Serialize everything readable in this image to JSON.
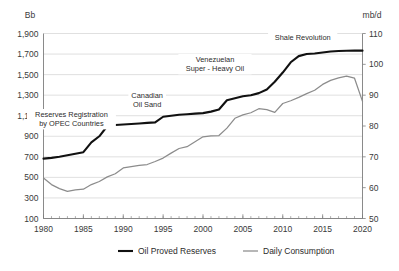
{
  "chart_data": {
    "type": "line",
    "title": "",
    "subtitle": "",
    "xlabel": "",
    "ylabel": "Bb",
    "y2label": "mb/d",
    "xlim": [
      1980,
      2020
    ],
    "ylim": [
      100,
      1900
    ],
    "y2lim": [
      50,
      110
    ],
    "grid": true,
    "legend_position": "bottom",
    "x_ticks": [
      "1980",
      "1985",
      "1990",
      "1995",
      "2000",
      "2005",
      "2010",
      "2015",
      "2020"
    ],
    "x_tick_values": [
      1980,
      1985,
      1990,
      1995,
      2000,
      2005,
      2010,
      2015,
      2020
    ],
    "y_ticks": [
      "100",
      "300",
      "500",
      "700",
      "900",
      "1,100",
      "1,300",
      "1,500",
      "1,700",
      "1,900"
    ],
    "y_tick_values": [
      100,
      300,
      500,
      700,
      900,
      1100,
      1300,
      1500,
      1700,
      1900
    ],
    "y2_ticks": [
      "50",
      "60",
      "70",
      "80",
      "90",
      "100",
      "110"
    ],
    "y2_tick_values": [
      50,
      60,
      70,
      80,
      90,
      100,
      110
    ],
    "x": [
      1980,
      1981,
      1982,
      1983,
      1984,
      1985,
      1986,
      1987,
      1988,
      1989,
      1990,
      1991,
      1992,
      1993,
      1994,
      1995,
      1996,
      1997,
      1998,
      1999,
      2000,
      2001,
      2002,
      2003,
      2004,
      2005,
      2006,
      2007,
      2008,
      2009,
      2010,
      2011,
      2012,
      2013,
      2014,
      2015,
      2016,
      2017,
      2018,
      2019,
      2020
    ],
    "series": [
      {
        "name": "Oil Proved Reserves",
        "axis": "left",
        "unit": "Bb",
        "color": "#111111",
        "values": [
          683,
          690,
          700,
          715,
          730,
          745,
          840,
          900,
          1000,
          1010,
          1015,
          1020,
          1025,
          1030,
          1035,
          1090,
          1100,
          1110,
          1115,
          1120,
          1125,
          1140,
          1160,
          1250,
          1270,
          1290,
          1300,
          1320,
          1355,
          1430,
          1520,
          1620,
          1680,
          1700,
          1705,
          1715,
          1725,
          1730,
          1732,
          1733,
          1733
        ]
      },
      {
        "name": "Daily Consumption",
        "axis": "right",
        "unit": "mb/d",
        "color": "#8c8c8c",
        "values": [
          63.1,
          61.0,
          59.7,
          58.8,
          59.3,
          59.5,
          61.0,
          62.0,
          63.5,
          64.5,
          66.4,
          66.8,
          67.2,
          67.5,
          68.5,
          69.6,
          71.2,
          72.7,
          73.3,
          74.9,
          76.5,
          76.8,
          76.9,
          79.3,
          82.5,
          83.6,
          84.3,
          85.6,
          85.3,
          84.4,
          87.3,
          88.2,
          89.3,
          90.5,
          91.6,
          93.5,
          94.8,
          95.6,
          96.2,
          95.5,
          88.0
        ]
      }
    ],
    "annotations": [
      {
        "text": "Reserves Registration\nby OPEC Countries",
        "line1": "Reserves Registration",
        "line2": "by OPEC Countries",
        "x": 1983.5,
        "y_px": 117
      },
      {
        "text": "Canadian\nOil Sand",
        "line1": "Canadian",
        "line2": "Oil Sand",
        "x": 1993.0,
        "y_px": 98
      },
      {
        "text": "Venezuelan\nSuper - Heavy Oil",
        "line1": "Venezuelan",
        "line2": "Super - Heavy Oil",
        "x": 2001.5,
        "y_px": 62
      },
      {
        "text": "Shale Revolution",
        "line1": "Shale Revolution",
        "line2": "",
        "x": 2012.5,
        "y_px": 40
      }
    ],
    "legend": [
      {
        "label": "Oil Proved Reserves",
        "color": "#111111",
        "weight": "bold"
      },
      {
        "label": "Daily Consumption",
        "color": "#8c8c8c",
        "weight": "thin"
      }
    ]
  }
}
